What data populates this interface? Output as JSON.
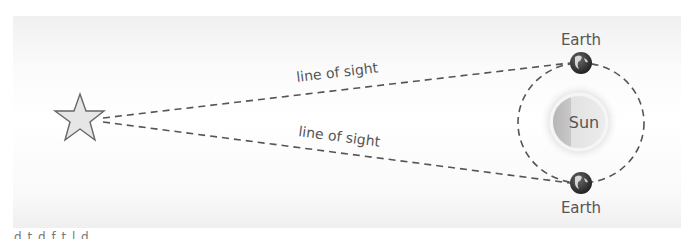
{
  "diagram": {
    "nodes": {
      "star": {
        "label": "",
        "icon": "star-icon"
      },
      "sun": {
        "label": "Sun"
      },
      "earth_top": {
        "label": "Earth"
      },
      "earth_bottom": {
        "label": "Earth"
      }
    },
    "edges": {
      "upper": {
        "label": "line of sight"
      },
      "lower": {
        "label": "line of sight"
      }
    },
    "orbit": {
      "style": "dashed"
    },
    "caption": "d  t  d            f  t  l  d"
  },
  "colors": {
    "line": "#555555",
    "star_fill": "#e6e6e6",
    "star_stroke": "#666666",
    "sun_light": "#dcdcdc",
    "sun_shadow": "#b8b8b8",
    "earth_ocean": "#3a3a3a",
    "earth_land": "#d8d8d8",
    "text": "#555555"
  }
}
